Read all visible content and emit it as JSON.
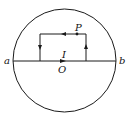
{
  "diagram": {
    "labels": {
      "a": "a",
      "b": "b",
      "P": "P",
      "I": "I",
      "O": "O"
    },
    "stroke_color": "#1a1a1a",
    "elements": [
      "circle",
      "diameter ab",
      "rectangular current loop",
      "point P",
      "center O"
    ],
    "arrows": {
      "top_edge": "left",
      "left_edge": "down",
      "right_edge": "up",
      "diameter_at_O": "right"
    }
  }
}
